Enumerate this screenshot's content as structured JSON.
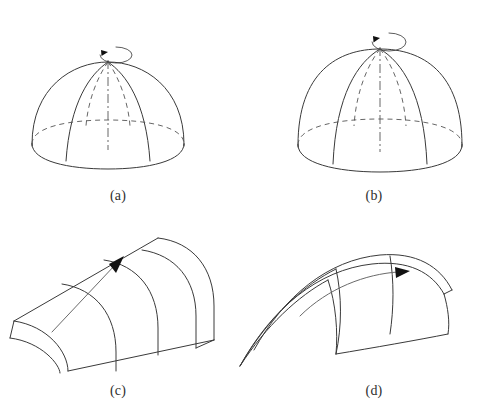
{
  "figure": {
    "background_color": "#ffffff",
    "line_color": "#3a3a3a",
    "hidden_line_color": "#555555",
    "arrow_color": "#6a6a6a",
    "arrowhead_color": "#111111"
  },
  "panels": [
    {
      "id": "a",
      "caption": "(a)",
      "shape": "dome-of-revolution",
      "description": "Shallow hemispherical dome generated by revolving an arc about a vertical axis",
      "axis_style": "dash-dot",
      "rotation_arrow": "counterclockwise-ellipse-with-arrowhead",
      "meridians_visible": 2,
      "meridians_hidden": 2,
      "base_ellipse": "front-solid-back-dashed",
      "caption_left": 78,
      "caption_top": 188
    },
    {
      "id": "b",
      "caption": "(b)",
      "shape": "dome-of-revolution",
      "description": "Taller hemispherical dome generated by revolving a steeper arc about a vertical axis",
      "axis_style": "dash-dot",
      "rotation_arrow": "counterclockwise-ellipse-with-arrowhead",
      "meridians_visible": 2,
      "meridians_hidden": 2,
      "base_ellipse": "front-solid-back-dashed",
      "caption_left": 334,
      "caption_top": 188
    },
    {
      "id": "c",
      "caption": "(c)",
      "shape": "barrel-vault-straight-sweep",
      "description": "Arch profile swept along a straight path forming a barrel vault",
      "sweep_arrow": "straight-with-arrowhead",
      "cross_sections": 3,
      "caption_left": 78,
      "caption_top": 383
    },
    {
      "id": "d",
      "caption": "(d)",
      "shape": "arch-curved-sweep",
      "description": "Arch profile swept along a curved path forming a warped vault",
      "sweep_arrow": "curved-with-arrowhead",
      "cross_sections": 3,
      "caption_left": 334,
      "caption_top": 383
    }
  ]
}
